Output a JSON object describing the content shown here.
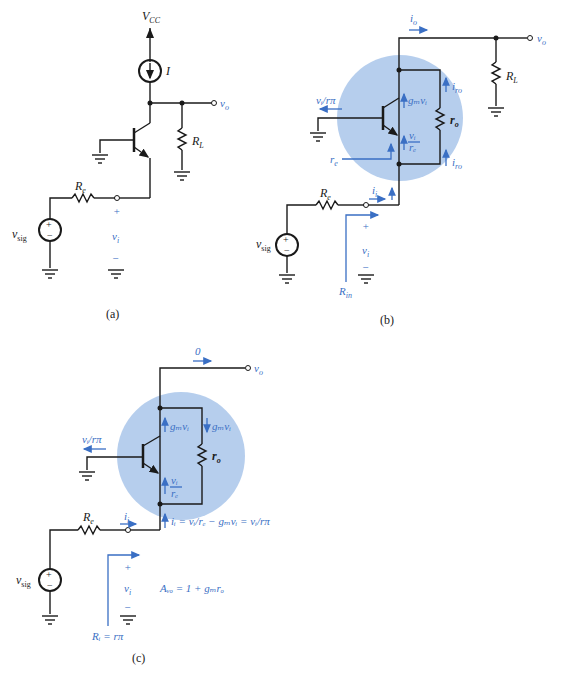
{
  "figure": {
    "colors": {
      "wire": "#1a1a1a",
      "annotation": "#3a6fc4",
      "highlight": "#a9c5ea"
    },
    "panel_a": {
      "caption": "(a)",
      "supply": "V",
      "supply_sub": "CC",
      "current_source": "I",
      "load": "R",
      "load_sub": "L",
      "source_res": "R",
      "source_res_sub": "e",
      "source": "v",
      "source_sub": "sig",
      "output": "v",
      "output_sub": "o",
      "input_v": "v",
      "input_v_sub": "i",
      "plus": "+",
      "minus": "−"
    },
    "panel_b": {
      "caption": "(b)",
      "io": "i",
      "io_sub": "o",
      "output": "v",
      "output_sub": "o",
      "load": "R",
      "load_sub": "L",
      "base_current": "vᵢ/rπ",
      "gm": "gₘvᵢ",
      "ro": "r",
      "ro_sub": "o",
      "iro_top": "i",
      "iro_top_sub": "ro",
      "iro_bot": "i",
      "iro_bot_sub": "ro",
      "emitter_frac_num": "vᵢ",
      "emitter_frac_den": "rₑ",
      "re_label": "r",
      "re_sub": "e",
      "ii": "i",
      "ii_sub": "i",
      "source_res": "R",
      "source_res_sub": "e",
      "source": "v",
      "source_sub": "sig",
      "input_v": "v",
      "input_v_sub": "i",
      "rin": "R",
      "rin_sub": "in",
      "plus": "+",
      "minus": "−"
    },
    "panel_c": {
      "caption": "(c)",
      "io_value": "0",
      "output": "v",
      "output_sub": "o",
      "gm_up": "gₘvᵢ",
      "gm_down": "gₘvᵢ",
      "base_current": "vᵢ/rπ",
      "ro": "r",
      "ro_sub": "o",
      "emitter_frac_num": "vᵢ",
      "emitter_frac_den": "rₑ",
      "ii_eq": "iᵢ = vᵢ/rₑ − gₘvᵢ = vᵢ/rπ",
      "ii": "i",
      "ii_sub": "i",
      "source_res": "R",
      "source_res_sub": "e",
      "source": "v",
      "source_sub": "sig",
      "input_v": "v",
      "input_v_sub": "i",
      "gain": "Aᵥₒ = 1 + gₘrₒ",
      "rin": "Rᵢ = rπ",
      "plus": "+",
      "minus": "−"
    }
  }
}
